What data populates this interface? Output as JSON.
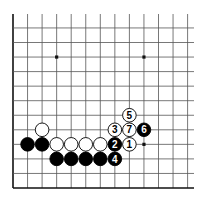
{
  "board": {
    "origin_x": 13,
    "origin_y": 188,
    "spacing": 14.55,
    "cols": 13,
    "rows": 12,
    "extend_right": 194,
    "extend_top": 14,
    "line_color": "#555555",
    "edge_color": "#111111",
    "black_color": "#000000",
    "white_fill": "#ffffff",
    "stone_radius": 6.8
  },
  "star_points": [
    {
      "col": 3,
      "row": 9
    },
    {
      "col": 9,
      "row": 9
    },
    {
      "col": 9,
      "row": 3
    }
  ],
  "stones": [
    {
      "color": "white",
      "col": 2,
      "row": 4,
      "label": ""
    },
    {
      "color": "black",
      "col": 1,
      "row": 3,
      "label": ""
    },
    {
      "color": "black",
      "col": 2,
      "row": 3,
      "label": ""
    },
    {
      "color": "white",
      "col": 3,
      "row": 3,
      "label": ""
    },
    {
      "color": "white",
      "col": 4,
      "row": 3,
      "label": ""
    },
    {
      "color": "white",
      "col": 5,
      "row": 3,
      "label": ""
    },
    {
      "color": "white",
      "col": 6,
      "row": 3,
      "label": ""
    },
    {
      "color": "black",
      "col": 7,
      "row": 3,
      "label": "2"
    },
    {
      "color": "white",
      "col": 8,
      "row": 3,
      "label": "1"
    },
    {
      "color": "black",
      "col": 3,
      "row": 2,
      "label": ""
    },
    {
      "color": "black",
      "col": 4,
      "row": 2,
      "label": ""
    },
    {
      "color": "black",
      "col": 5,
      "row": 2,
      "label": ""
    },
    {
      "color": "black",
      "col": 6,
      "row": 2,
      "label": ""
    },
    {
      "color": "black",
      "col": 7,
      "row": 2,
      "label": "4"
    },
    {
      "color": "white",
      "col": 7,
      "row": 4,
      "label": "3"
    },
    {
      "color": "white",
      "col": 8,
      "row": 4,
      "label": "7"
    },
    {
      "color": "black",
      "col": 9,
      "row": 4,
      "label": "6"
    },
    {
      "color": "white",
      "col": 8,
      "row": 5,
      "label": "5"
    }
  ]
}
